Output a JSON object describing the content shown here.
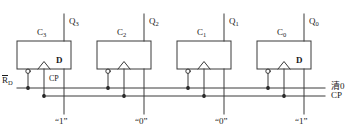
{
  "diagram": {
    "stroke_color": "#3a3a3a",
    "text_color": "#1a1a1a"
  },
  "flipflops": [
    {
      "name": "C3",
      "box_label": "C",
      "box_sub": "3",
      "q_label": "Q",
      "q_sub": "3",
      "d_label": "D",
      "show_d": true,
      "data_value": "“1”"
    },
    {
      "name": "C2",
      "box_label": "C",
      "box_sub": "2",
      "q_label": "Q",
      "q_sub": "2",
      "d_label": "D",
      "show_d": false,
      "data_value": "“0”"
    },
    {
      "name": "C1",
      "box_label": "C",
      "box_sub": "1",
      "q_label": "Q",
      "q_sub": "1",
      "d_label": "D",
      "show_d": false,
      "data_value": "“0”"
    },
    {
      "name": "C0",
      "box_label": "C",
      "box_sub": "0",
      "q_label": "Q",
      "q_sub": "0",
      "d_label": "D",
      "show_d": true,
      "data_value": "“1”"
    }
  ],
  "pins": {
    "reset_label": "R",
    "reset_sub": "D",
    "clock_label": "CP"
  },
  "buses": [
    {
      "id": "clear",
      "label": "清0"
    },
    {
      "id": "clock",
      "label": "CP"
    }
  ],
  "data_values": [
    "“1”",
    "“0”",
    "“0”",
    "“1”"
  ]
}
